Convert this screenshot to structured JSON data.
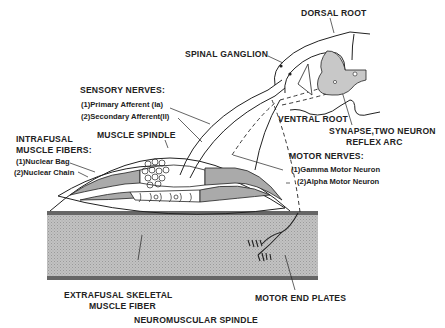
{
  "title": "NEUROMUSCULAR SPINDLE",
  "labels": {
    "dorsal_root": "DORSAL ROOT",
    "spinal_ganglion": "SPINAL GANGLION",
    "ventral_root": "VENTRAL ROOT",
    "synapse_line1": "SYNAPSE,TWO NEURON",
    "synapse_line2": "REFLEX ARC",
    "sensory_nerves": "SENSORY NERVES:",
    "sensory_items": [
      "(1)Primary Afferent (Ia)",
      "(2)Secondary Afferent(II)"
    ],
    "intrafusal_line1": "INTRAFUSAL",
    "intrafusal_line2": "MUSCLE FIBERS:",
    "intrafusal_items": [
      "(1)Nuclear Bag",
      "(2)Nuclear Chain"
    ],
    "muscle_spindle": "MUSCLE SPINDLE",
    "motor_nerves": "MOTOR NERVES:",
    "motor_items": [
      "(1)Gamma Motor Neuron",
      "(2)Alpha Motor Neuron"
    ],
    "extrafusal_line1": "EXTRAFUSAL SKELETAL",
    "extrafusal_line2": "MUSCLE FIBER",
    "motor_end_plates": "MOTOR END PLATES"
  },
  "colors": {
    "ink": "#222222",
    "muscle_fill": "#b9b9b9",
    "muscle_band": "#6a6a6a",
    "gray_matter": "#c8c8c8"
  }
}
